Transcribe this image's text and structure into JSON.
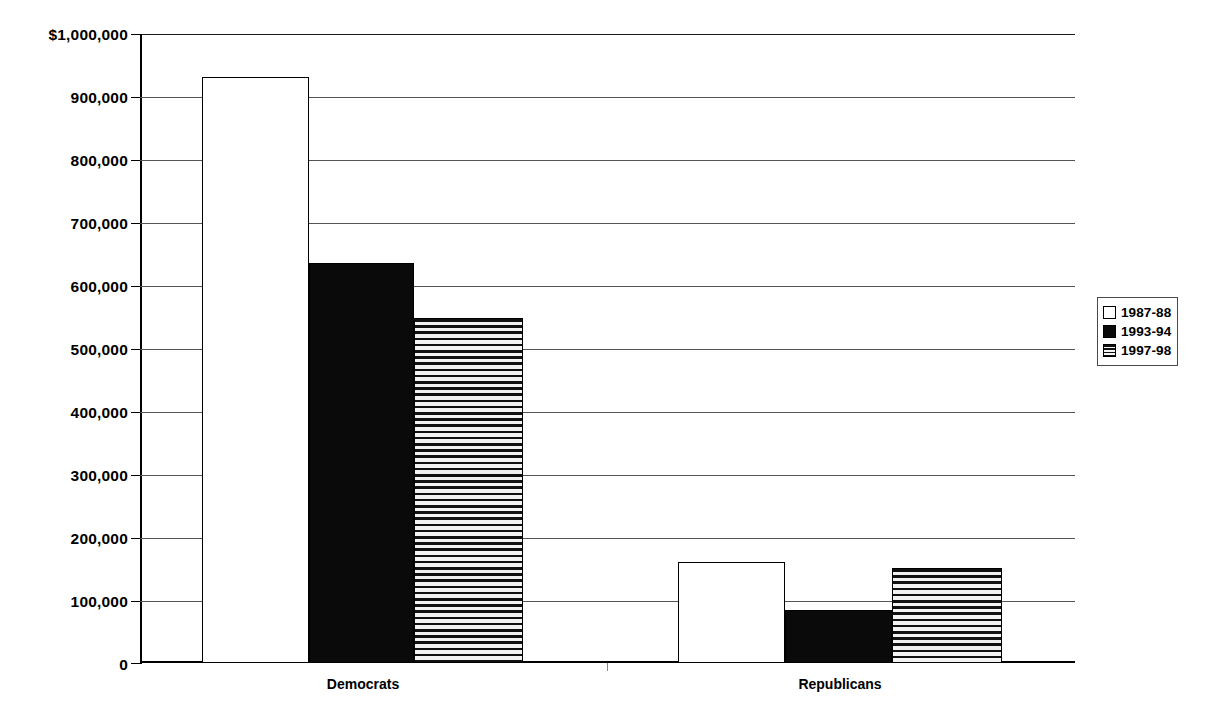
{
  "chart_data": {
    "type": "bar",
    "title": "",
    "subtitle": "",
    "xlabel": "",
    "ylabel": "",
    "categories": [
      "Democrats",
      "Republicans"
    ],
    "series": [
      {
        "name": "1987-88",
        "style": "white",
        "values": [
          932000,
          160000
        ]
      },
      {
        "name": "1993-94",
        "style": "black",
        "values": [
          636000,
          84000
        ]
      },
      {
        "name": "1997-98",
        "style": "striped",
        "values": [
          549000,
          151000
        ]
      }
    ],
    "ylim": [
      0,
      1000000
    ],
    "ytick_values": [
      0,
      100000,
      200000,
      300000,
      400000,
      500000,
      600000,
      700000,
      800000,
      900000,
      1000000
    ],
    "ytick_labels": [
      "0",
      "100,000",
      "200,000",
      "300,000",
      "400,000",
      "500,000",
      "600,000",
      "700,000",
      "800,000",
      "900,000",
      "$1,000,000"
    ],
    "grid": true,
    "grid_axis": "y",
    "legend_position": "right",
    "colors": {
      "series_1987_88": "#ffffff",
      "series_1993_94": "#0a0a0a",
      "series_1997_98": "#111111",
      "axis": "#000000",
      "gridline": "#555555",
      "background": "#ffffff"
    }
  },
  "legend": {
    "items": [
      {
        "label": "1987-88",
        "style": "white"
      },
      {
        "label": "1993-94",
        "style": "black"
      },
      {
        "label": "1997-98",
        "style": "striped"
      }
    ]
  },
  "axis": {
    "y_labels": [
      "$1,000,000",
      "900,000",
      "800,000",
      "700,000",
      "600,000",
      "500,000",
      "400,000",
      "300,000",
      "200,000",
      "100,000",
      "0"
    ],
    "x_labels": [
      "Democrats",
      "Republicans"
    ]
  }
}
